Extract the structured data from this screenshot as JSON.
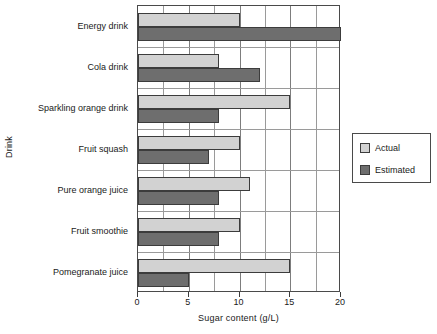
{
  "chart_data": {
    "type": "bar",
    "orientation": "horizontal",
    "title": "",
    "xlabel": "Sugar content (g/L)",
    "ylabel": "Drink",
    "xlim": [
      0,
      20
    ],
    "xticks": [
      0,
      5,
      10,
      15,
      20
    ],
    "xtick_labels": [
      "0",
      "5",
      "10",
      "15",
      "20"
    ],
    "minor_gridline_step": 2.5,
    "grid": true,
    "legend_position": "right",
    "categories": [
      "Energy drink",
      "Cola drink",
      "Sparkling orange drink",
      "Fruit squash",
      "Pure orange juice",
      "Fruit smoothie",
      "Pomegranate juice"
    ],
    "series": [
      {
        "name": "Actual",
        "color": "#d2d2d2",
        "values": [
          10,
          8,
          15,
          10,
          11,
          10,
          15
        ]
      },
      {
        "name": "Estimated",
        "color": "#6e6e6e",
        "values": [
          20,
          12,
          8,
          7,
          8,
          8,
          5
        ]
      }
    ]
  },
  "legend": {
    "entries": [
      {
        "label": "Actual",
        "swatch": "actual"
      },
      {
        "label": "Estimated",
        "swatch": "estimated"
      }
    ]
  },
  "colors": {
    "actual": "#d2d2d2",
    "estimated": "#6e6e6e",
    "axis": "#4a4a4a",
    "grid": "#9a9a9a",
    "background": "#ffffff"
  }
}
